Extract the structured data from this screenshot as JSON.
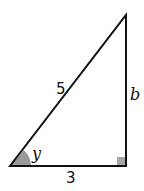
{
  "diagram": {
    "type": "right-triangle",
    "vertices": {
      "bottom_left": [
        10,
        166
      ],
      "bottom_right_right_angle": [
        126,
        166
      ],
      "top": [
        126,
        15
      ]
    },
    "labels": {
      "hypotenuse": "5",
      "vertical_leg": "b",
      "horizontal_leg": "3",
      "angle": "y"
    },
    "colors": {
      "stroke": "#111111",
      "angle_fill": "#999999",
      "right_angle_fill": "#a6a6a6",
      "background": "#ffffff"
    }
  }
}
